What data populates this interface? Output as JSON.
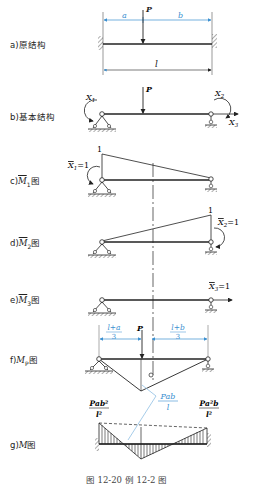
{
  "figure": {
    "caption": "图 12-20   例 12-2 图",
    "accent_color": "#3a8fd0",
    "line_color": "#222222",
    "panels": [
      {
        "id": "a",
        "label": "a)原结构",
        "dims": {
          "left": "a",
          "right": "b",
          "span": "l"
        },
        "load": "P"
      },
      {
        "id": "b",
        "label": "b)基本结构",
        "load": "P",
        "unknowns": [
          "X1",
          "X2",
          "X3"
        ]
      },
      {
        "id": "c",
        "label": "c)M̄1图",
        "value_label": "1",
        "unit_force": "X̄1=1"
      },
      {
        "id": "d",
        "label": "d)M̄2图",
        "value_label": "1",
        "unit_force": "X̄2=1"
      },
      {
        "id": "e",
        "label": "e)M̄3图",
        "unit_force": "X̄3=1"
      },
      {
        "id": "f",
        "label": "f)MP图",
        "dims": {
          "left": "(l+a)/3",
          "right": "(l+b)/3"
        },
        "load": "P",
        "peak_label": "Pab/l"
      },
      {
        "id": "g",
        "label": "g)M图",
        "left_end_label": "Pab²/l²",
        "right_end_label": "Pa²b/l²"
      }
    ]
  },
  "text": {
    "a_label": "a)原结构",
    "b_label": "b)基本结构",
    "c_label_prefix": "c)",
    "c_label_M": "M",
    "c_label_sub": "1",
    "c_label_suffix": "图",
    "d_label_prefix": "d)",
    "d_label_M": "M",
    "d_label_sub": "2",
    "d_label_suffix": "图",
    "e_label_prefix": "e)",
    "e_label_M": "M",
    "e_label_sub": "3",
    "e_label_suffix": "图",
    "f_label_prefix": "f)",
    "f_label_M": "M",
    "f_label_sub": "P",
    "f_label_suffix": "图",
    "g_label_prefix": "g)",
    "g_label_M": "M",
    "g_label_suffix": "图",
    "dim_a": "a",
    "dim_b": "b",
    "dim_l": "l",
    "P": "P",
    "X1": "X",
    "X1_sub": "1",
    "X2": "X",
    "X2_sub": "2",
    "X3": "X",
    "X3_sub": "3",
    "one": "1",
    "eq1": "=1",
    "f_left_num": "l+a",
    "f_left_den": "3",
    "f_right_num": "l+b",
    "f_right_den": "3",
    "pab_num": "Pab",
    "pab_den": "l",
    "g_left_num": "Pab²",
    "g_left_den": "l²",
    "g_right_num": "Pa²b",
    "g_right_den": "l²",
    "caption": "图 12-20   例 12-2 图"
  }
}
